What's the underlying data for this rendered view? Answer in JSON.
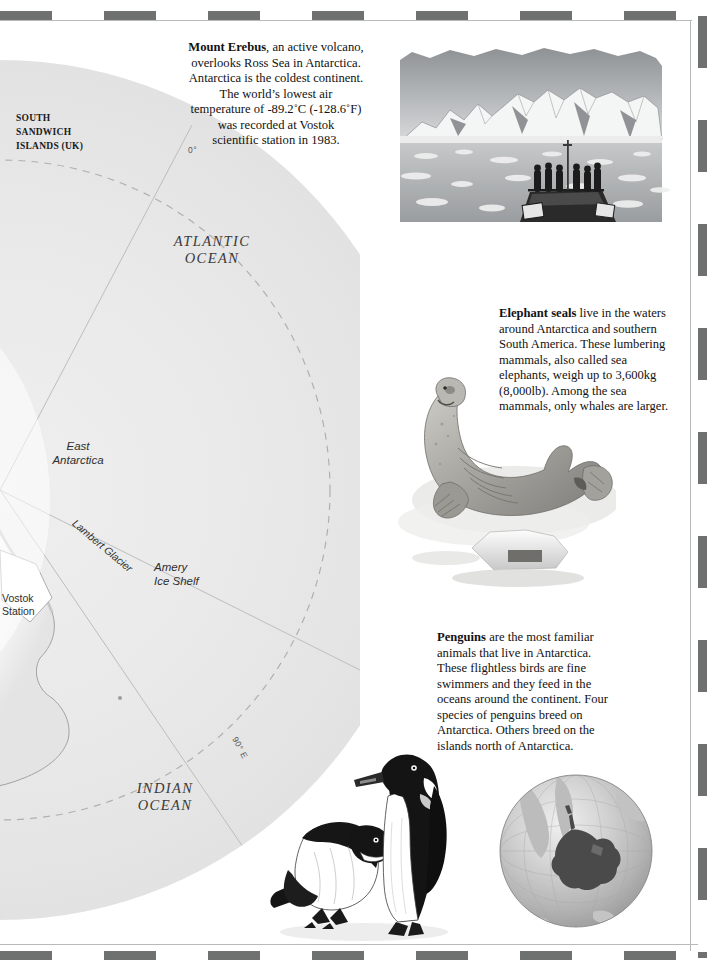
{
  "page": {
    "subject": "Antarctica",
    "background_color": "#ffffff",
    "border_color": "#6f7070"
  },
  "map": {
    "name": "antarctica-polar-map",
    "ocean_fill": "#e9e9e9",
    "land_fill": "#fbfbfb",
    "labels": {
      "south_sandwich": "SOUTH\nSANDWICH\nISLANDS (UK)",
      "atlantic_ocean": "ATLANTIC\nOCEAN",
      "indian_ocean": "INDIAN\nOCEAN",
      "east_antarctica": "East\nAntarctica",
      "lambert_glacier": "Lambert Glacier",
      "amery_ice_shelf": "Amery\nIce Shelf",
      "vostok_station": "Vostok\nStation",
      "meridian_zero": "0°",
      "meridian_ninety_east": "90° E"
    }
  },
  "captions": {
    "erebus": {
      "title": "Mount Erebus",
      "lines": [
        ", an active volcano,",
        "overlooks Ross Sea in Antarctica.",
        "Antarctica is the coldest continent.",
        "The world’s lowest air",
        "temperature of -89.2˚C (-128.6˚F)",
        "was recorded at Vostok",
        "scientific station in 1983."
      ]
    },
    "elephant_seals": {
      "title": "Elephant seals",
      "body": " live in the waters around Antarctica and southern South America. These lumbering mammals, also called sea elephants, weigh up to 3,600kg (8,000lb). Among the sea mammals, only whales are larger."
    },
    "penguins": {
      "title": "Penguins",
      "body": " are the most familiar animals that live in Antarctica. These flightless birds are fine swimmers and they feed in the oceans around the continent. Four species of penguins breed on Antarctica. Others breed on the islands north of Antarctica."
    }
  },
  "illustrations": {
    "erebus": "mount-erebus-ship-illustration",
    "seal": "elephant-seal-illustration",
    "penguins": "two-penguins-illustration",
    "globe": "globe-antarctica-locator-illustration"
  }
}
